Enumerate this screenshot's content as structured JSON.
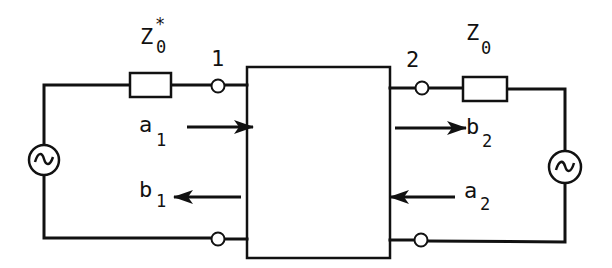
{
  "diagram": {
    "type": "two-port network with wave quantities",
    "impedances": {
      "left": {
        "base": "Z",
        "subscript": "0",
        "superscript": "*"
      },
      "right": {
        "base": "Z",
        "subscript": "0"
      }
    },
    "ports": {
      "port1": "1",
      "port2": "2"
    },
    "waves": {
      "a1": {
        "base": "a",
        "subscript": "1",
        "direction": "into network"
      },
      "b1": {
        "base": "b",
        "subscript": "1",
        "direction": "out of network"
      },
      "b2": {
        "base": "b",
        "subscript": "2",
        "direction": "out of network"
      },
      "a2": {
        "base": "a",
        "subscript": "2",
        "direction": "into network"
      }
    },
    "sources": {
      "left": "~",
      "right": "~"
    },
    "colors": {
      "stroke": "#111111",
      "background": "#ffffff"
    }
  }
}
